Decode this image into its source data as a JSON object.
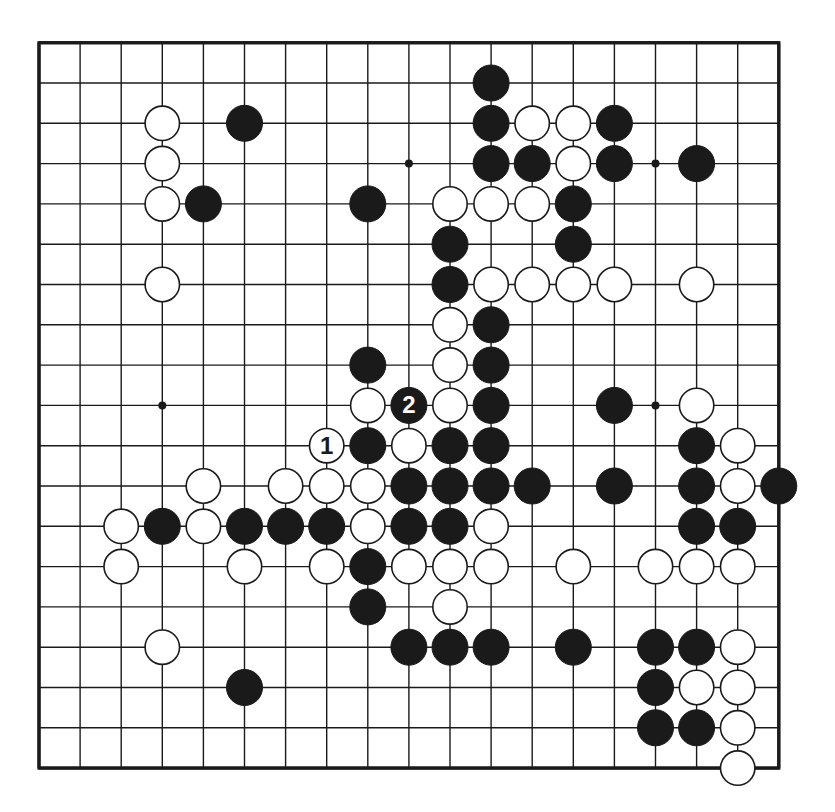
{
  "board": {
    "size": 19,
    "origin_x": 39,
    "origin_y": 42.7,
    "spacing_x": 41.1,
    "spacing_y": 40.3,
    "stone_radius": 18,
    "line_color": "#1a1a1a",
    "background": "#ffffff",
    "black_color": "#1a1a1a",
    "white_fill": "#ffffff",
    "star_points": [
      [
        9,
        3
      ],
      [
        15,
        3
      ],
      [
        3,
        9
      ],
      [
        15,
        9
      ]
    ]
  },
  "stones": {
    "black": [
      [
        11,
        1
      ],
      [
        5,
        2
      ],
      [
        11,
        2
      ],
      [
        14,
        2
      ],
      [
        11,
        3
      ],
      [
        12,
        3
      ],
      [
        14,
        3
      ],
      [
        16,
        3
      ],
      [
        4,
        4
      ],
      [
        8,
        4
      ],
      [
        13,
        4
      ],
      [
        10,
        5
      ],
      [
        13,
        5
      ],
      [
        10,
        6
      ],
      [
        11,
        7
      ],
      [
        8,
        8
      ],
      [
        11,
        8
      ],
      [
        11,
        9
      ],
      [
        14,
        9
      ],
      [
        8,
        10
      ],
      [
        10,
        10
      ],
      [
        11,
        10
      ],
      [
        16,
        10
      ],
      [
        9,
        11
      ],
      [
        10,
        11
      ],
      [
        11,
        11
      ],
      [
        12,
        11
      ],
      [
        14,
        11
      ],
      [
        16,
        11
      ],
      [
        18,
        11
      ],
      [
        3,
        12
      ],
      [
        5,
        12
      ],
      [
        6,
        12
      ],
      [
        7,
        12
      ],
      [
        9,
        12
      ],
      [
        10,
        12
      ],
      [
        16,
        12
      ],
      [
        17,
        12
      ],
      [
        8,
        13
      ],
      [
        8,
        14
      ],
      [
        9,
        15
      ],
      [
        10,
        15
      ],
      [
        11,
        15
      ],
      [
        13,
        15
      ],
      [
        15,
        15
      ],
      [
        16,
        15
      ],
      [
        5,
        16
      ],
      [
        15,
        16
      ],
      [
        15,
        17
      ],
      [
        16,
        17
      ]
    ],
    "white": [
      [
        3,
        2
      ],
      [
        12,
        2
      ],
      [
        13,
        2
      ],
      [
        3,
        3
      ],
      [
        13,
        3
      ],
      [
        3,
        4
      ],
      [
        10,
        4
      ],
      [
        11,
        4
      ],
      [
        12,
        4
      ],
      [
        3,
        6
      ],
      [
        11,
        6
      ],
      [
        12,
        6
      ],
      [
        13,
        6
      ],
      [
        14,
        6
      ],
      [
        16,
        6
      ],
      [
        10,
        7
      ],
      [
        10,
        8
      ],
      [
        8,
        9
      ],
      [
        10,
        9
      ],
      [
        16,
        9
      ],
      [
        9,
        10
      ],
      [
        17,
        10
      ],
      [
        4,
        11
      ],
      [
        6,
        11
      ],
      [
        7,
        11
      ],
      [
        8,
        11
      ],
      [
        17,
        11
      ],
      [
        2,
        12
      ],
      [
        4,
        12
      ],
      [
        8,
        12
      ],
      [
        11,
        12
      ],
      [
        2,
        13
      ],
      [
        5,
        13
      ],
      [
        7,
        13
      ],
      [
        9,
        13
      ],
      [
        10,
        13
      ],
      [
        11,
        13
      ],
      [
        13,
        13
      ],
      [
        15,
        13
      ],
      [
        16,
        13
      ],
      [
        17,
        13
      ],
      [
        10,
        14
      ],
      [
        3,
        15
      ],
      [
        17,
        15
      ],
      [
        16,
        16
      ],
      [
        17,
        16
      ],
      [
        17,
        17
      ],
      [
        17,
        18
      ]
    ]
  },
  "moves": [
    {
      "number": "1",
      "color": "white",
      "col": 7,
      "row": 10
    },
    {
      "number": "2",
      "color": "black",
      "col": 9,
      "row": 9
    }
  ]
}
